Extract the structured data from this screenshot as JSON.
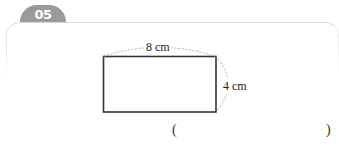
{
  "problem": {
    "number": "05",
    "figure": {
      "shape": "rectangle",
      "width_label": "8 cm",
      "height_label": "4 cm",
      "width": 8,
      "height": 4,
      "unit": "cm"
    },
    "answer": {
      "open_paren": "(",
      "close_paren": ")",
      "value": ""
    }
  },
  "colors": {
    "badge": "#9a9a9a",
    "card_border": "#d8d8d8",
    "stroke": "#333333",
    "dashed": "#999999"
  }
}
